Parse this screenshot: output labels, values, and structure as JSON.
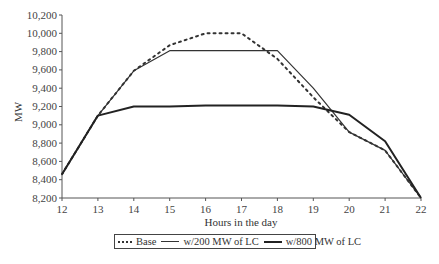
{
  "chart_data": {
    "type": "line",
    "title": "",
    "xlabel": "Hours in the day",
    "ylabel": "MW",
    "x": [
      12,
      13,
      14,
      15,
      16,
      17,
      18,
      19,
      20,
      21,
      22
    ],
    "xlim": [
      12,
      22
    ],
    "ylim": [
      8200,
      10200
    ],
    "x_ticks": [
      "12",
      "13",
      "14",
      "15",
      "16",
      "17",
      "18",
      "19",
      "20",
      "21",
      "22"
    ],
    "y_ticks": [
      "8,200",
      "8,400",
      "8,600",
      "8,800",
      "9,000",
      "9,200",
      "9,400",
      "9,600",
      "9,800",
      "10,000",
      "10,200"
    ],
    "y_tick_values": [
      8200,
      8400,
      8600,
      8800,
      9000,
      9200,
      9400,
      9600,
      9800,
      10000,
      10200
    ],
    "grid": false,
    "legend_position": "bottom",
    "series": [
      {
        "name": "Base",
        "style": "dotted",
        "color": "#333333",
        "values": [
          8460,
          9100,
          9590,
          9870,
          10000,
          10000,
          9720,
          9300,
          8920,
          8720,
          8200
        ]
      },
      {
        "name": "w/200 MW of LC",
        "style": "thin",
        "color": "#333333",
        "values": [
          8460,
          9100,
          9590,
          9810,
          9810,
          9810,
          9810,
          9400,
          8920,
          8720,
          8200
        ]
      },
      {
        "name": "w/800 MW of LC",
        "style": "thick",
        "color": "#222222",
        "values": [
          8460,
          9100,
          9200,
          9200,
          9210,
          9210,
          9210,
          9200,
          9110,
          8820,
          8200
        ]
      }
    ]
  },
  "legend": {
    "items": [
      {
        "label": "Base"
      },
      {
        "label": "w/200 MW of LC"
      },
      {
        "label": "w/800 MW of LC"
      }
    ]
  }
}
